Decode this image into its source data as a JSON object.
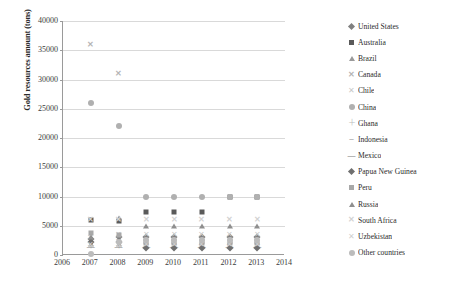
{
  "chart_data": {
    "type": "scatter",
    "title": "",
    "xlabel": "",
    "ylabel": "Gold resources amount (tons)",
    "xlim": [
      2006,
      2014
    ],
    "ylim": [
      0,
      40000
    ],
    "x_ticks": [
      "2006",
      "2007",
      "2008",
      "2009",
      "2010",
      "2011",
      "2012",
      "2013",
      "2014"
    ],
    "y_ticks": [
      "0",
      "5000",
      "10000",
      "15000",
      "20000",
      "25000",
      "30000",
      "35000",
      "40000"
    ],
    "grid": "horizontal",
    "legend_position": "right",
    "x": [
      2007,
      2008,
      2009,
      2010,
      2011,
      2012,
      2013
    ],
    "series": [
      {
        "name": "United States",
        "marker": "diamond",
        "color": "#808080",
        "values": [
          2700,
          3000,
          3000,
          3000,
          3000,
          3000,
          3000
        ]
      },
      {
        "name": "Australia",
        "marker": "square",
        "color": "#5a5a5a",
        "values": [
          6000,
          5800,
          7400,
          7400,
          7400,
          9900,
          9900
        ]
      },
      {
        "name": "Brazil",
        "marker": "triangle",
        "color": "#9a9a9a",
        "values": [
          1900,
          1900,
          2400,
          2400,
          2400,
          2400,
          2400
        ]
      },
      {
        "name": "Canada",
        "marker": "x-bold",
        "color": "#b5b5b5",
        "values": [
          35900,
          31000,
          1400,
          1400,
          1400,
          1400,
          1400
        ]
      },
      {
        "name": "Chile",
        "marker": "x-thin",
        "color": "#c8c8c8",
        "values": [
          2900,
          3400,
          3400,
          3400,
          3400,
          3400,
          3400
        ]
      },
      {
        "name": "China",
        "marker": "circle",
        "color": "#b0b0b0",
        "values": [
          26000,
          22000,
          10000,
          10000,
          10000,
          10000,
          10000
        ]
      },
      {
        "name": "Ghana",
        "marker": "plus",
        "color": "#bdbdbd",
        "values": [
          1600,
          1600,
          1400,
          1400,
          1400,
          1400,
          1400
        ]
      },
      {
        "name": "Indonesia",
        "marker": "dash",
        "color": "#8c8c8c",
        "values": [
          2800,
          2800,
          3000,
          3000,
          3000,
          3000,
          3000
        ]
      },
      {
        "name": "Mexico",
        "marker": "dash-long",
        "color": "#777777",
        "values": [
          1400,
          1400,
          1400,
          1400,
          1400,
          1400,
          1400
        ]
      },
      {
        "name": "Papua New Guinea",
        "marker": "diamond",
        "color": "#6f6f6f",
        "values": [
          2300,
          2300,
          1200,
          1200,
          1200,
          1200,
          1200
        ]
      },
      {
        "name": "Peru",
        "marker": "square",
        "color": "#a8a8a8",
        "values": [
          3800,
          3500,
          2000,
          2000,
          2000,
          2000,
          2000
        ]
      },
      {
        "name": "Russia",
        "marker": "triangle",
        "color": "#8f8f8f",
        "values": [
          3000,
          6300,
          5000,
          5000,
          5000,
          5000,
          5000
        ]
      },
      {
        "name": "South Africa",
        "marker": "x-bold",
        "color": "#d2d2d2",
        "values": [
          6000,
          6000,
          6000,
          6000,
          6000,
          6000,
          6000
        ]
      },
      {
        "name": "Uzbekistan",
        "marker": "x-thin",
        "color": "#cfcfcf",
        "values": [
          1700,
          1700,
          1700,
          1700,
          1700,
          1700,
          1700
        ]
      },
      {
        "name": "Other countries",
        "marker": "circle",
        "color": "#bcbcbc",
        "values": [
          200,
          2200,
          2600,
          2600,
          2600,
          2600,
          2600
        ]
      }
    ]
  },
  "legend": {
    "items": [
      {
        "label": "United States"
      },
      {
        "label": "Australia"
      },
      {
        "label": "Brazil"
      },
      {
        "label": "Canada"
      },
      {
        "label": "Chile"
      },
      {
        "label": "China"
      },
      {
        "label": "Ghana"
      },
      {
        "label": "Indonesia"
      },
      {
        "label": "Mexico"
      },
      {
        "label": "Papua New Guinea"
      },
      {
        "label": "Peru"
      },
      {
        "label": "Russia"
      },
      {
        "label": "South Africa"
      },
      {
        "label": "Uzbekistan"
      },
      {
        "label": "Other countries"
      }
    ]
  }
}
